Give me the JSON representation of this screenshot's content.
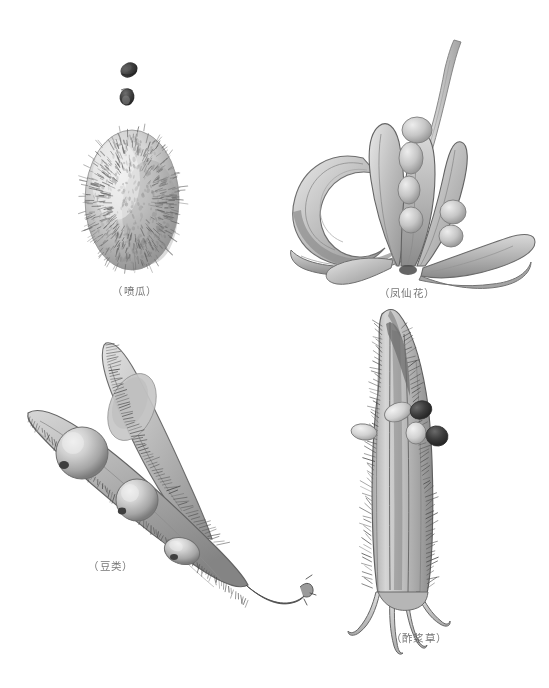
{
  "plate": {
    "title": "",
    "background_color": "#ffffff",
    "ink_color": "#6b6b6b",
    "width": 549,
    "height": 688,
    "medium": "grayscale botanical illustration"
  },
  "figures": [
    {
      "id": "squirting-cucumber",
      "caption": "（喷瓜）",
      "caption_x": 88,
      "caption_y": 283,
      "caption_width": 94,
      "parts": [
        "seed-upper",
        "seed-lower",
        "hairy-ovoid-fruit"
      ]
    },
    {
      "id": "impatiens",
      "caption": "（凤仙花）",
      "caption_x": 366,
      "caption_y": 285,
      "caption_width": 82,
      "parts": [
        "coiled-valve",
        "stalk",
        "dehisced-capsule",
        "seeds"
      ]
    },
    {
      "id": "legume",
      "caption": "（豆类）",
      "caption_x": 74,
      "caption_y": 558,
      "caption_width": 74,
      "parts": [
        "split-pod-upper-valve",
        "split-pod-lower-valve",
        "seed-1",
        "seed-2",
        "seed-3",
        "twisted-tip"
      ]
    },
    {
      "id": "oxalis",
      "caption": "（酢浆草）",
      "caption_x": 377,
      "caption_y": 630,
      "caption_width": 84,
      "parts": [
        "ribbed-hairy-capsule",
        "ejected-seeds",
        "basal-sepals"
      ]
    }
  ],
  "colors": {
    "paper": "#ffffff",
    "caption_text": "#5d5d5d",
    "outline_dark": "#4a4a4a",
    "outline_mid": "#777777",
    "fill_light": "#dcdcdc",
    "fill_mid": "#b4b4b4",
    "fill_dark": "#8a8a8a",
    "seed_dark": "#3a3a3a"
  }
}
